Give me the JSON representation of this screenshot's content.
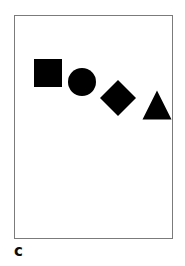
{
  "figure": {
    "panel_label": "c",
    "background_color": "#ffffff",
    "frame": {
      "border_color": "#7b7b7b",
      "border_width_px": 1,
      "fill_color": "#ffffff",
      "x": 14,
      "y": 15,
      "width": 159,
      "height": 224
    },
    "shape_color": "#000000",
    "shapes": [
      {
        "name": "square",
        "glyph": "filled-square",
        "center_x": 48,
        "center_y": 73,
        "size": 28
      },
      {
        "name": "circle",
        "glyph": "filled-circle",
        "center_x": 82,
        "center_y": 82,
        "size": 28
      },
      {
        "name": "diamond",
        "glyph": "filled-diamond",
        "center_x": 118,
        "center_y": 98,
        "size": 36
      },
      {
        "name": "triangle",
        "glyph": "filled-triangle",
        "center_x": 157,
        "center_y": 105,
        "size": 29
      }
    ]
  }
}
